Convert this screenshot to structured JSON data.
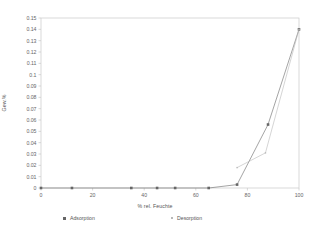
{
  "chart_data": {
    "type": "line",
    "title": "",
    "xlabel": "% rel. Feuchte",
    "ylabel": "Gew.%",
    "xlim": [
      0,
      100
    ],
    "ylim": [
      0,
      0.15
    ],
    "grid": false,
    "legend_position": "bottom",
    "xticks": [
      0,
      20,
      40,
      60,
      80,
      100
    ],
    "xtick_labels": [
      "0",
      "20",
      "40",
      "60",
      "80",
      "100"
    ],
    "yticks": [
      0,
      0.01,
      0.02,
      0.03,
      0.04,
      0.05,
      0.06,
      0.07,
      0.08,
      0.09,
      0.1,
      0.11,
      0.12,
      0.13,
      0.14,
      0.15
    ],
    "ytick_labels": [
      "0",
      "0.01",
      "0.02",
      "0.03",
      "0.04",
      "0.05",
      "0.06",
      "0.07",
      "0.08",
      "0.09",
      "0.1",
      "0.11",
      "0.12",
      "0.13",
      "0.14",
      "0.15"
    ],
    "series": [
      {
        "name": "Adsorption",
        "color": "#666666",
        "marker": "square",
        "x": [
          0,
          12,
          35,
          45,
          52,
          65,
          76,
          88,
          100
        ],
        "values": [
          0,
          0,
          0,
          0,
          0,
          0,
          0.003,
          0.056,
          0.14
        ]
      },
      {
        "name": "Desorption",
        "color": "#b8b8b8",
        "marker": "small-square",
        "x": [
          76,
          87,
          100
        ],
        "values": [
          0.018,
          0.031,
          0.14
        ]
      }
    ]
  },
  "legend": {
    "items": [
      {
        "label": "Adsorption"
      },
      {
        "label": "Desorption"
      }
    ]
  },
  "axes": {
    "x_title": "% rel. Feuchte",
    "y_title": "Gew.%"
  }
}
